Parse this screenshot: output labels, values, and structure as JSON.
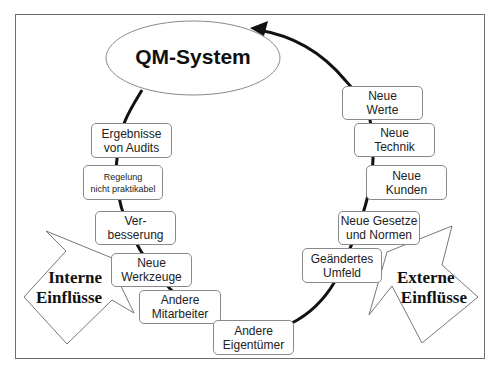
{
  "diagram": {
    "center": {
      "label": "QM-System"
    },
    "internal": {
      "title_line1": "Interne",
      "title_line2": "Einflüsse",
      "items": [
        {
          "line1": "Ergebnisse",
          "line2": "von Audits"
        },
        {
          "line1": "Regelung",
          "line2": "nicht praktikabel"
        },
        {
          "line1": "Ver-",
          "line2": "besserung"
        },
        {
          "line1": "Neue",
          "line2": "Werkzeuge"
        },
        {
          "line1": "Andere",
          "line2": "Mitarbeiter"
        },
        {
          "line1": "Andere",
          "line2": "Eigentümer"
        }
      ]
    },
    "external": {
      "title_line1": "Externe",
      "title_line2": "Einflüsse",
      "items": [
        {
          "line1": "Neue",
          "line2": "Werte"
        },
        {
          "line1": "Neue",
          "line2": "Technik"
        },
        {
          "line1": "Neue",
          "line2": "Kunden"
        },
        {
          "line1": "Neue Gesetze",
          "line2": "und Normen"
        },
        {
          "line1": "Geändertes",
          "line2": "Umfeld"
        }
      ]
    },
    "colors": {
      "line": "#111111",
      "border": "#8a8a8a",
      "frame": "#6e6e6e"
    }
  }
}
